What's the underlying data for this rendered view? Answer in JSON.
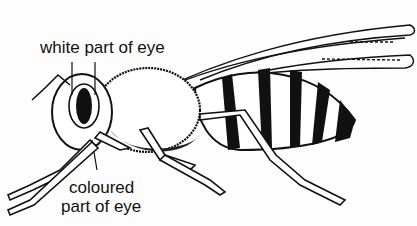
{
  "figure": {
    "labels": {
      "white_eye": "white part of eye",
      "coloured_eye_line1": "coloured",
      "coloured_eye_line2": "part of eye"
    },
    "colors": {
      "ink": "#111111",
      "paper": "#fdfdfd"
    }
  }
}
